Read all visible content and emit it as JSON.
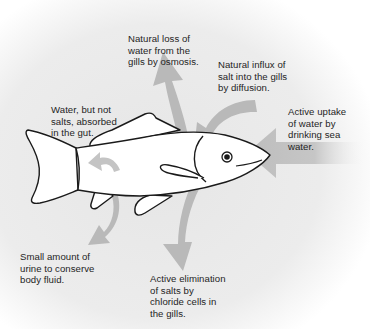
{
  "diagram": {
    "colors": {
      "background": "#e9e9e9",
      "background_fade": "#ffffff",
      "arrow": "#b9b9b9",
      "fish_fill": "#ffffff",
      "fish_outline": "#1a1a1a",
      "text": "#1e1e1e"
    },
    "labels": {
      "water_loss": "Natural loss of\nwater from the\ngills by osmosis.",
      "salt_influx": "Natural influx of\nsalt into the gills\nby diffusion.",
      "gut_absorption": "Water, but not\nsalts, absorbed\nin the gut.",
      "drinking": "Active uptake\nof water by\ndrinking sea\nwater.",
      "urine": "Small amount of\nurine to conserve\nbody fluid.",
      "salt_elimination": "Active elimination\nof salts by\nchloride cells in\nthe gills."
    },
    "arrows": [
      {
        "id": "water_loss",
        "direction": "up, out of gills"
      },
      {
        "id": "salt_influx",
        "direction": "down-left, into gills"
      },
      {
        "id": "gut_absorption",
        "direction": "curved, within body"
      },
      {
        "id": "drinking",
        "direction": "left, into mouth"
      },
      {
        "id": "urine",
        "direction": "down-left, out of vent"
      },
      {
        "id": "salt_elimination",
        "direction": "down, out of gills"
      }
    ]
  }
}
